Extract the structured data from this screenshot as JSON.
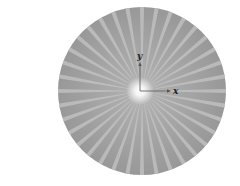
{
  "figure": {
    "disk": {
      "center": [
        142,
        91
      ],
      "radius": 84,
      "color": "#9c9c9c",
      "ray_color": "#c4c4c4",
      "ray_count": 36,
      "center_glow_color": "#ffffff"
    },
    "axes": {
      "origin": [
        140,
        91
      ],
      "x_axis_end": [
        171,
        91
      ],
      "y_axis_end": [
        140,
        62
      ],
      "color": "#555555",
      "x_label": "x",
      "y_label": "y"
    }
  }
}
